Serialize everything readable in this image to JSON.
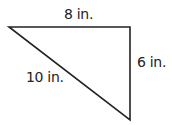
{
  "diagram": {
    "shape": "right triangle",
    "sides": {
      "top": "8 in.",
      "right": "6 in.",
      "hypotenuse": "10 in."
    },
    "stroke_color": "#222222"
  }
}
